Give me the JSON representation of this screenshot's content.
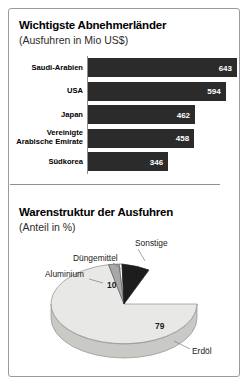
{
  "bars_section": {
    "title": "Wichtigste Abnehmerländer",
    "subtitle": "(Ausfuhren in Mio US$)"
  },
  "pie_section": {
    "title": "Warenstruktur der Ausfuhren",
    "subtitle": "(Anteil in %)"
  },
  "chart_data": [
    {
      "type": "bar",
      "title": "Wichtigste Abnehmerländer",
      "subtitle": "(Ausfuhren in Mio US$)",
      "xlabel": "",
      "ylabel": "",
      "orientation": "horizontal",
      "grid": false,
      "xlim": [
        0,
        643
      ],
      "categories": [
        "Saudi-Arabien",
        "USA",
        "Japan",
        "Vereinigte\nArabische Emirate",
        "Südkorea"
      ],
      "values": [
        643,
        594,
        462,
        458,
        346
      ],
      "bar_color": "#2b2b2b",
      "value_label_color": "#ffffff"
    },
    {
      "type": "pie",
      "title": "Warenstruktur der Ausfuhren",
      "subtitle": "(Anteil in %)",
      "unit": "%",
      "labels": [
        "Erdöl",
        "Aluminium",
        "Düngemittel",
        "Sonstige"
      ],
      "values": [
        79,
        10,
        2,
        9
      ],
      "colors": [
        "#e8e8e6",
        "#a8a8a8",
        "#ffffff",
        "#1d1d1d"
      ],
      "legend": "callout-labels",
      "style": "3d-ellipse"
    }
  ]
}
